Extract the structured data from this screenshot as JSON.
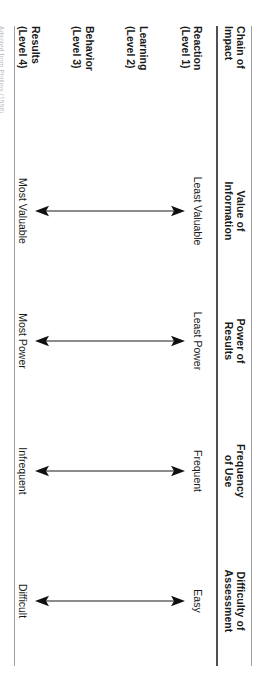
{
  "figure": {
    "orientation": "rotated-90-clockwise",
    "rule_color": "#4c5155",
    "arrow_color": "#1a1a1a"
  },
  "table": {
    "header": [
      {
        "line1": "Chain of",
        "line2": "Impact"
      },
      {
        "line1": "Value of",
        "line2": "Information"
      },
      {
        "line1": "Power of",
        "line2": "Results"
      },
      {
        "line1": "Frequency",
        "line2": "of Use"
      },
      {
        "line1": "Difficulty of",
        "line2": "Assessment"
      }
    ],
    "levels": [
      {
        "name": "Reaction",
        "level": "(Level 1)"
      },
      {
        "name": "Learning",
        "level": "(Level 2)"
      },
      {
        "name": "Behavior",
        "level": "(Level 3)"
      },
      {
        "name": "Results",
        "level": "(Level 4)"
      }
    ],
    "axes": [
      {
        "column": "Value of Information",
        "top": "Least Valuable",
        "bottom": "Most Valuable"
      },
      {
        "column": "Power of Results",
        "top": "Least Power",
        "bottom": "Most Power"
      },
      {
        "column": "Frequency of Use",
        "top": "Frequent",
        "bottom": "Infrequent"
      },
      {
        "column": "Difficulty of Assessment",
        "top": "Easy",
        "bottom": "Difficult"
      }
    ]
  },
  "source_note": "Adapted from Phillips (1996)"
}
